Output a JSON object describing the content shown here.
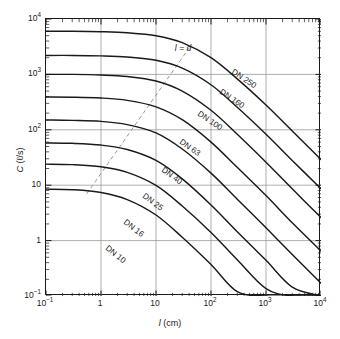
{
  "chart_data": {
    "type": "line",
    "title": "",
    "xlabel": "l (cm)",
    "ylabel": "C (ℓ/s)",
    "xscale": "log",
    "yscale": "log",
    "xlim": [
      0.1,
      10000
    ],
    "ylim": [
      0.1,
      10000
    ],
    "grid": true,
    "grid_decades": true,
    "legend": "inline-curve-labels",
    "xticks": [
      "10⁻¹",
      "1",
      "10",
      "10²",
      "10³",
      "10⁴"
    ],
    "xtick_values": [
      0.1,
      1,
      10,
      100,
      1000,
      10000
    ],
    "yticks": [
      "10⁻¹",
      "1",
      "10",
      "10²",
      "10³",
      "10⁴"
    ],
    "ytick_values": [
      0.1,
      1,
      10,
      100,
      1000,
      10000
    ],
    "annotations": [
      {
        "text": "l = d",
        "x": 22,
        "y": 2600,
        "style": "italic",
        "attached_to": "dashed-reference-line"
      }
    ],
    "reference_line": {
      "name": "l = d",
      "style": "dashed",
      "x": [
        0.55,
        40
      ],
      "y": [
        7.0,
        3000
      ]
    },
    "series": [
      {
        "name": "DN 250",
        "plateau": 6000,
        "x": [
          0.1,
          0.3,
          1,
          3,
          10,
          30,
          100,
          300,
          1000,
          3000,
          10000
        ],
        "y": [
          6000,
          6000,
          5900,
          5650,
          5000,
          3750,
          2000,
          830,
          280,
          95,
          29
        ]
      },
      {
        "name": "DN 160",
        "plateau": 2200,
        "x": [
          0.1,
          0.3,
          1,
          3,
          10,
          30,
          100,
          300,
          1000,
          3000,
          10000
        ],
        "y": [
          2200,
          2200,
          2160,
          2060,
          1800,
          1300,
          650,
          255,
          83,
          28,
          8.6
        ]
      },
      {
        "name": "DN 100",
        "plateau": 1000,
        "x": [
          0.1,
          0.3,
          1,
          3,
          10,
          30,
          100,
          300,
          1000,
          3000,
          10000
        ],
        "y": [
          1000,
          1000,
          975,
          915,
          760,
          500,
          225,
          83,
          26,
          8.6,
          2.6
        ]
      },
      {
        "name": "DN 63",
        "plateau": 390,
        "x": [
          0.1,
          0.3,
          1,
          3,
          10,
          30,
          100,
          300,
          1000,
          3000,
          10000
        ],
        "y": [
          390,
          388,
          375,
          340,
          260,
          152,
          60,
          21,
          6.5,
          2.1,
          0.65
        ]
      },
      {
        "name": "DN 40",
        "plateau": 150,
        "x": [
          0.1,
          0.3,
          1,
          3,
          10,
          30,
          100,
          300,
          1000,
          3000,
          10000
        ],
        "y": [
          150,
          148,
          142,
          124,
          88,
          45,
          16.5,
          5.6,
          1.7,
          0.56,
          0.17
        ]
      },
      {
        "name": "DN 25",
        "plateau": 58,
        "x": [
          0.1,
          0.3,
          1,
          3,
          10,
          30,
          100,
          300,
          1000,
          3000,
          10000
        ],
        "y": [
          58,
          57,
          53,
          44,
          28,
          13,
          4.4,
          1.45,
          0.44,
          0.145,
          0.1
        ]
      },
      {
        "name": "DN 16",
        "plateau": 24,
        "x": [
          0.1,
          0.3,
          1,
          3,
          10,
          30,
          100,
          300,
          1000,
          3000,
          10000
        ],
        "y": [
          24,
          23.5,
          21.5,
          17,
          9.9,
          4.2,
          1.4,
          0.45,
          0.136,
          0.1,
          0.1
        ]
      },
      {
        "name": "DN 10",
        "plateau": 8.5,
        "x": [
          0.1,
          0.3,
          1,
          3,
          10,
          30,
          100,
          300,
          1000,
          3000,
          10000
        ],
        "y": [
          8.5,
          8.3,
          7.4,
          5.5,
          2.9,
          1.15,
          0.37,
          0.12,
          0.1,
          0.1,
          0.1
        ]
      }
    ]
  },
  "axes": {
    "x": {
      "label_italic": "l",
      "label_unit": "(cm)",
      "ticks": [
        {
          "label_base": "10",
          "label_exp": "−1"
        },
        {
          "label_base": "1",
          "label_exp": ""
        },
        {
          "label_base": "10",
          "label_exp": ""
        },
        {
          "label_base": "10",
          "label_exp": "2"
        },
        {
          "label_base": "10",
          "label_exp": "3"
        },
        {
          "label_base": "10",
          "label_exp": "4"
        }
      ]
    },
    "y": {
      "label_italic": "C",
      "label_unit": "(ℓ/s)",
      "ticks": [
        {
          "label_base": "10",
          "label_exp": "4"
        },
        {
          "label_base": "10",
          "label_exp": "3"
        },
        {
          "label_base": "10",
          "label_exp": "2"
        },
        {
          "label_base": "10",
          "label_exp": ""
        },
        {
          "label_base": "1",
          "label_exp": ""
        },
        {
          "label_base": "10",
          "label_exp": "−1"
        }
      ]
    }
  },
  "colors": {
    "axis": "#1a1a1a",
    "curve": "#1a1a1a",
    "grid": "#8c8c8c",
    "reference_line": "#8c8c8c",
    "background": "#ffffff"
  }
}
